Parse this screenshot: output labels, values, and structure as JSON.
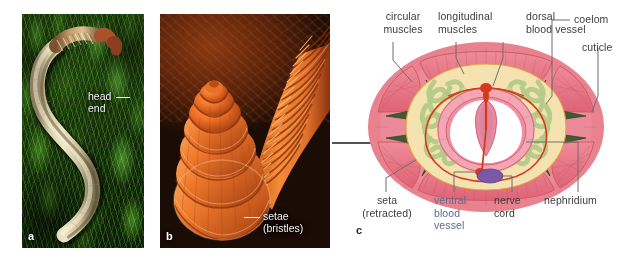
{
  "figure": {
    "panels": [
      {
        "tag": "a",
        "name": "earthworm-whole-photo",
        "caption_lines": [
          "head",
          "end"
        ],
        "caption_text": "head end"
      },
      {
        "tag": "b",
        "name": "earthworm-sem-photo",
        "caption_lines": [
          "setae",
          "(bristles)"
        ],
        "caption_text": "setae (bristles)"
      },
      {
        "tag": "c",
        "name": "earthworm-cross-section-diagram"
      }
    ],
    "arrow": {
      "name": "arrow-b-to-c",
      "direction": "right"
    }
  },
  "diagram": {
    "labels_top": [
      {
        "id": "circular-muscles",
        "lines": [
          "circular",
          "muscles"
        ],
        "text": "circular muscles"
      },
      {
        "id": "longitudinal-muscles",
        "lines": [
          "longitudinal",
          "muscles"
        ],
        "text": "longitudinal muscles"
      },
      {
        "id": "dorsal-blood-vessel",
        "lines": [
          "dorsal",
          "blood vessel"
        ],
        "text": "dorsal blood vessel"
      },
      {
        "id": "coelom",
        "lines": [
          "coelom"
        ],
        "text": "coelom"
      },
      {
        "id": "cuticle",
        "lines": [
          "cuticle"
        ],
        "text": "cuticle"
      }
    ],
    "labels_bottom": [
      {
        "id": "seta-retracted",
        "lines": [
          "seta",
          "(retracted)"
        ],
        "text": "seta (retracted)"
      },
      {
        "id": "ventral-blood-vessel",
        "lines": [
          "ventral",
          "blood",
          "vessel"
        ],
        "text": "ventral blood vessel",
        "color": "#5b6a93"
      },
      {
        "id": "nerve-cord",
        "lines": [
          "nerve",
          "cord"
        ],
        "text": "nerve cord"
      },
      {
        "id": "nephridium",
        "lines": [
          "nephridium"
        ],
        "text": "nephridium"
      }
    ],
    "colors": {
      "body_wall_pink": "#e8818c",
      "muscle_pink": "#e36f7e",
      "cuticle_outline": "#d4606f",
      "coelom_cream": "#f2e2ae",
      "nephridium_green": "#b9ce8e",
      "blood_vessel_red": "#d63a1e",
      "nerve_cord_purple": "#7b57a8",
      "seta_dark_green": "#3f5b33",
      "gut_pink": "#ef8fa0",
      "gut_lumen_white": "#ffffff",
      "leader_line": "#6e6e6e"
    }
  }
}
